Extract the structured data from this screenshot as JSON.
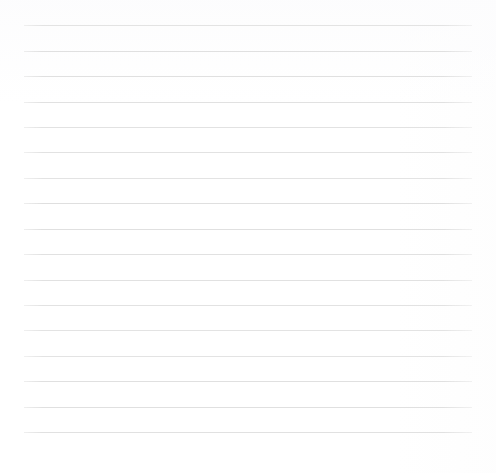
{
  "document": {
    "kind": "ruled-paper",
    "title": "Blank ruled notebook page",
    "content_text": "",
    "page_width": 496,
    "page_height": 473,
    "background_color": "#ffffff",
    "rule_color": "#dedede",
    "rule_thickness": 1,
    "rule_count": 17,
    "rule_left": 24,
    "rule_right": 472,
    "rule_length": 448,
    "first_rule_y": 25,
    "last_rule_y": 432,
    "rule_spacing": 25.4,
    "margin_top": 25,
    "margin_bottom": 41,
    "margin_left": 24,
    "margin_right": 24,
    "has_margin_rule": false,
    "has_text": false,
    "rules": [
      {
        "index": 1,
        "y": 25,
        "x1": 24,
        "x2": 472
      },
      {
        "index": 2,
        "y": 51,
        "x1": 24,
        "x2": 472
      },
      {
        "index": 3,
        "y": 76,
        "x1": 24,
        "x2": 472
      },
      {
        "index": 4,
        "y": 102,
        "x1": 24,
        "x2": 472
      },
      {
        "index": 5,
        "y": 127,
        "x1": 24,
        "x2": 472
      },
      {
        "index": 6,
        "y": 152,
        "x1": 24,
        "x2": 472
      },
      {
        "index": 7,
        "y": 178,
        "x1": 24,
        "x2": 472
      },
      {
        "index": 8,
        "y": 203,
        "x1": 24,
        "x2": 472
      },
      {
        "index": 9,
        "y": 229,
        "x1": 24,
        "x2": 472
      },
      {
        "index": 10,
        "y": 254,
        "x1": 24,
        "x2": 472
      },
      {
        "index": 11,
        "y": 280,
        "x1": 24,
        "x2": 472
      },
      {
        "index": 12,
        "y": 305,
        "x1": 24,
        "x2": 472
      },
      {
        "index": 13,
        "y": 330,
        "x1": 24,
        "x2": 472
      },
      {
        "index": 14,
        "y": 356,
        "x1": 24,
        "x2": 472
      },
      {
        "index": 15,
        "y": 381,
        "x1": 24,
        "x2": 472
      },
      {
        "index": 16,
        "y": 407,
        "x1": 24,
        "x2": 472
      },
      {
        "index": 17,
        "y": 432,
        "x1": 24,
        "x2": 472
      }
    ]
  }
}
